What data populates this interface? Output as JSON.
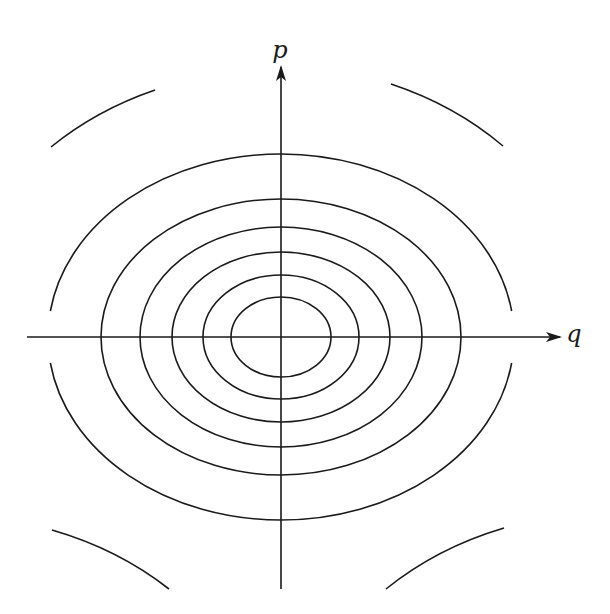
{
  "diagram": {
    "stroke_color": "#1a1a1a",
    "background": "#ffffff",
    "center": {
      "x": 281,
      "y": 337
    },
    "axes": {
      "horizontal": {
        "label": "q",
        "x1": 27,
        "x2": 560,
        "y": 337,
        "label_pos": {
          "x": 574,
          "y": 334
        }
      },
      "vertical": {
        "label": "p",
        "x": 281,
        "y1": 589,
        "y2": 67,
        "label_pos": {
          "x": 280,
          "y": 50
        }
      }
    },
    "closed_ellipses": [
      {
        "rx": 50,
        "ry": 40
      },
      {
        "rx": 78,
        "ry": 62
      },
      {
        "rx": 109,
        "ry": 85
      },
      {
        "rx": 141,
        "ry": 110
      },
      {
        "rx": 180,
        "ry": 138
      }
    ],
    "open_ellipse": {
      "rx": 233,
      "ry": 183,
      "note": "gaps where the curve crosses the q-axis",
      "gap_half_height": 26
    },
    "outer_arcs": {
      "rx": 326,
      "ry": 268,
      "segments": [
        {
          "name": "top-left",
          "from": {
            "x": 51,
            "y": 147
          },
          "to": {
            "x": 155,
            "y": 90
          }
        },
        {
          "name": "top-right",
          "from": {
            "x": 391,
            "y": 84
          },
          "to": {
            "x": 503,
            "y": 146
          }
        },
        {
          "name": "bottom-left",
          "from": {
            "x": 52,
            "y": 530
          },
          "to": {
            "x": 169,
            "y": 589
          }
        },
        {
          "name": "bottom-right",
          "from": {
            "x": 386,
            "y": 589
          },
          "to": {
            "x": 504,
            "y": 528
          }
        }
      ]
    }
  }
}
